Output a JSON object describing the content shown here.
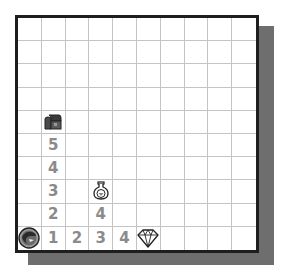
{
  "board": {
    "rows": 10,
    "cols": 10,
    "colors": {
      "border": "#1e1e1e",
      "shadow": "#6e6e6e",
      "grid_line": "#c4c4c4",
      "number": "#8a8a8a",
      "background": "#ffffff"
    },
    "items": [
      {
        "row": 4,
        "col": 1,
        "type": "icon",
        "icon": "treasure-chest-icon"
      },
      {
        "row": 5,
        "col": 1,
        "type": "number",
        "value": "5"
      },
      {
        "row": 6,
        "col": 1,
        "type": "number",
        "value": "4"
      },
      {
        "row": 7,
        "col": 1,
        "type": "number",
        "value": "3"
      },
      {
        "row": 7,
        "col": 3,
        "type": "icon",
        "icon": "potion-icon"
      },
      {
        "row": 8,
        "col": 1,
        "type": "number",
        "value": "2"
      },
      {
        "row": 8,
        "col": 3,
        "type": "number",
        "value": "4"
      },
      {
        "row": 9,
        "col": 0,
        "type": "icon",
        "icon": "player-avatar-icon"
      },
      {
        "row": 9,
        "col": 1,
        "type": "number",
        "value": "1"
      },
      {
        "row": 9,
        "col": 2,
        "type": "number",
        "value": "2"
      },
      {
        "row": 9,
        "col": 3,
        "type": "number",
        "value": "3"
      },
      {
        "row": 9,
        "col": 4,
        "type": "number",
        "value": "4"
      },
      {
        "row": 9,
        "col": 5,
        "type": "icon",
        "icon": "diamond-icon"
      }
    ]
  }
}
